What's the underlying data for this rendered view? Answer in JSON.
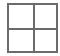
{
  "icon": {
    "name": "grid-2x2-icon",
    "rows": 2,
    "columns": 2,
    "line_color": "#6b6b6b",
    "background": "#ffffff"
  }
}
